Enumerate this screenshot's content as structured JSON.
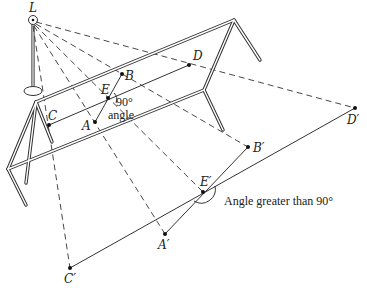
{
  "diagram": {
    "colors": {
      "ink": "#333333",
      "background": "#ffffff"
    },
    "points": {
      "L": {
        "label": "L"
      },
      "A": {
        "label": "A"
      },
      "B": {
        "label": "B"
      },
      "C": {
        "label": "C"
      },
      "D": {
        "label": "D"
      },
      "E": {
        "label": "E"
      },
      "A_prime": {
        "label": "A′"
      },
      "B_prime": {
        "label": "B′"
      },
      "C_prime": {
        "label": "C′"
      },
      "D_prime": {
        "label": "D′"
      },
      "E_prime": {
        "label": "E′"
      }
    },
    "annotations": {
      "right_angle_degrees": "90°",
      "right_angle_word": "angle",
      "projected_angle": "Angle greater than 90°"
    },
    "icons": {
      "lamp": "light-source-lamp-icon"
    }
  }
}
